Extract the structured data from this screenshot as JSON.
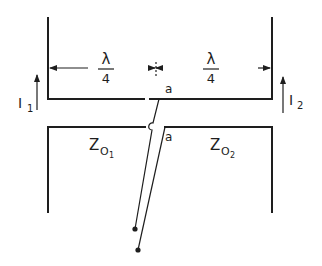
{
  "diagram": {
    "dimensions": {
      "left_span": {
        "numerator": "λ",
        "denominator": "4"
      },
      "right_span": {
        "numerator": "λ",
        "denominator": "4"
      }
    },
    "currents": {
      "left": {
        "symbol": "I",
        "subscript": "1"
      },
      "right": {
        "symbol": "I",
        "subscript": "2"
      }
    },
    "impedances": {
      "left": {
        "symbol": "Z",
        "sub1": "O",
        "sub2": "1"
      },
      "right": {
        "symbol": "Z",
        "sub1": "O",
        "sub2": "2"
      }
    },
    "terminals": {
      "upper": "a",
      "lower": "a"
    },
    "colors": {
      "ink": "#1e1e1e",
      "background": "#ffffff"
    }
  }
}
